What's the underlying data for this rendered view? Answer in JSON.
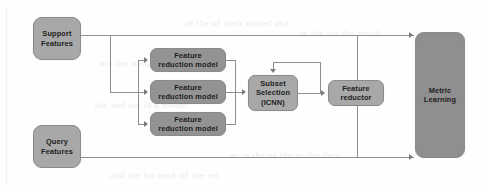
{
  "figure": {
    "type": "block-flow-diagram",
    "background_color": "#fefefe",
    "node_fill_color": "#9e9e9e",
    "node_border_color": "#8a8a8a",
    "connector_color": "#8f8f8f",
    "arrow_color": "#7a7a7a"
  },
  "nodes": {
    "support_features": {
      "line1": "Support",
      "line2": "Features"
    },
    "query_features": {
      "line1": "Query",
      "line2": "Features"
    },
    "feature_reduction_model_1": {
      "line1": "Feature",
      "line2": "reduction model"
    },
    "feature_reduction_model_2": {
      "line1": "Feature",
      "line2": "reduction model"
    },
    "feature_reduction_model_3": {
      "line1": "Feature",
      "line2": "reduction model"
    },
    "subset_selection": {
      "line1": "Subset",
      "line2": "Selection",
      "line3": "(ICNN)"
    },
    "feature_reductor": {
      "line1": "Feature",
      "line2": "reductor"
    },
    "metric_learning": {
      "line1": "Metric",
      "line2": "Learning"
    }
  },
  "edges": [
    {
      "from": "support_features",
      "to": "metric_learning",
      "label": ""
    },
    {
      "from": "support_features",
      "to": "feature_reduction_model_1",
      "label": ""
    },
    {
      "from": "support_features",
      "to": "feature_reduction_model_2",
      "label": ""
    },
    {
      "from": "support_features",
      "to": "feature_reduction_model_3",
      "label": ""
    },
    {
      "from": "feature_reduction_model_1",
      "to": "subset_selection",
      "label": ""
    },
    {
      "from": "feature_reduction_model_2",
      "to": "subset_selection",
      "label": ""
    },
    {
      "from": "feature_reduction_model_3",
      "to": "subset_selection",
      "label": ""
    },
    {
      "from": "subset_selection",
      "to": "feature_reductor",
      "label": ""
    },
    {
      "from": "feature_reductor",
      "to": "subset_selection",
      "label": ""
    },
    {
      "from": "query_features",
      "to": "metric_learning",
      "label": ""
    }
  ],
  "bleed_text": {
    "l1": "of the of their model and",
    "l2": "in the for the result",
    "l3": "are the with a subset",
    "l4": "the and for in a model",
    "l5": "as in the of the to the data",
    "l6": "and the for each of the set"
  }
}
